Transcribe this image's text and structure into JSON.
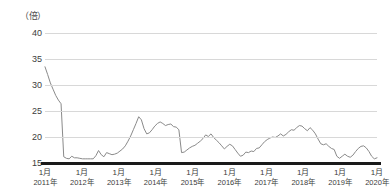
{
  "chart_data": {
    "type": "line",
    "title": "",
    "subtitle": "",
    "xlabel": "",
    "ylabel": "",
    "unit_label": "（倍）",
    "ylim": [
      15,
      40
    ],
    "yticks": [
      15,
      20,
      25,
      30,
      35,
      40
    ],
    "ytick_labels": [
      "15",
      "20",
      "25",
      "30",
      "35",
      "40"
    ],
    "grid": true,
    "legend": false,
    "legend_position": "none",
    "line_color": "#8a8a8a",
    "axis_color": "#1a1a1a",
    "grid_color": "#d8d8d8",
    "xticks": [
      {
        "month": "1月",
        "year": "2011年"
      },
      {
        "month": "1月",
        "year": "2012年"
      },
      {
        "month": "1月",
        "year": "2013年"
      },
      {
        "month": "1月",
        "year": "2014年"
      },
      {
        "month": "1月",
        "year": "2015年"
      },
      {
        "month": "1月",
        "year": "2016年"
      },
      {
        "month": "1月",
        "year": "2017年"
      },
      {
        "month": "1月",
        "year": "2018年"
      },
      {
        "month": "1月",
        "year": "2019年"
      },
      {
        "month": "1月",
        "year": "2020年"
      }
    ],
    "x_start": "2011-01",
    "x_end": "2020-01",
    "x_step_months": 1,
    "series": [
      {
        "name": "PER",
        "values": [
          33.5,
          32.0,
          30.4,
          29.2,
          28.0,
          27.1,
          26.4,
          16.2,
          15.9,
          15.8,
          16.3,
          16.0,
          16.0,
          15.9,
          15.8,
          15.8,
          15.8,
          15.8,
          15.8,
          16.4,
          17.4,
          16.6,
          16.2,
          17.0,
          16.8,
          16.6,
          16.7,
          16.9,
          17.3,
          17.7,
          18.3,
          19.2,
          20.2,
          21.4,
          22.6,
          23.9,
          23.3,
          21.6,
          20.6,
          20.8,
          21.4,
          22.1,
          22.6,
          22.9,
          22.6,
          22.2,
          22.4,
          22.5,
          22.0,
          21.9,
          21.4,
          17.0,
          17.1,
          17.5,
          17.9,
          18.2,
          18.4,
          18.8,
          19.2,
          19.7,
          20.4,
          20.1,
          20.6,
          19.9,
          19.4,
          18.9,
          18.3,
          17.7,
          18.2,
          18.6,
          18.3,
          17.6,
          16.9,
          16.3,
          16.5,
          17.1,
          17.0,
          17.3,
          17.2,
          17.8,
          17.9,
          18.5,
          19.1,
          19.5,
          19.8,
          20.0,
          19.9,
          20.2,
          20.6,
          20.2,
          20.5,
          21.0,
          21.4,
          21.3,
          21.8,
          22.2,
          22.1,
          21.6,
          21.2,
          21.8,
          21.3,
          20.6,
          19.6,
          18.7,
          18.5,
          18.7,
          18.2,
          17.8,
          17.6,
          16.3,
          15.9,
          16.3,
          16.7,
          16.3,
          16.1,
          16.5,
          17.2,
          17.8,
          18.2,
          18.3,
          17.9,
          17.2,
          16.3,
          15.8,
          16.0
        ]
      }
    ]
  }
}
